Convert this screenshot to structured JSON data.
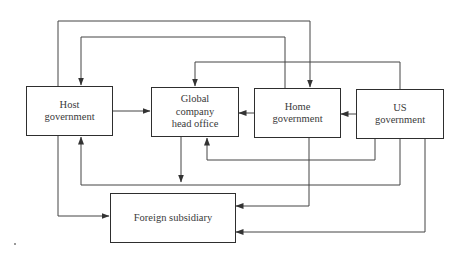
{
  "diagram": {
    "type": "flow",
    "nodes": [
      {
        "id": "host",
        "label": "Host\ngovernment"
      },
      {
        "id": "hq",
        "label": "Global\ncompany\nhead office"
      },
      {
        "id": "home",
        "label": "Home\ngovernment"
      },
      {
        "id": "us",
        "label": "US\ngovernment"
      },
      {
        "id": "sub",
        "label": "Foreign subsidiary"
      }
    ],
    "edges": [
      {
        "from": "host",
        "to": "hq"
      },
      {
        "from": "home",
        "to": "hq"
      },
      {
        "from": "us",
        "to": "home"
      },
      {
        "from": "host",
        "to": "home"
      },
      {
        "from": "home",
        "to": "host"
      },
      {
        "from": "us",
        "to": "hq"
      },
      {
        "from": "hq",
        "to": "sub"
      },
      {
        "from": "host",
        "to": "sub"
      },
      {
        "from": "us",
        "to": "hq"
      },
      {
        "from": "us",
        "to": "host"
      },
      {
        "from": "home",
        "to": "sub"
      },
      {
        "from": "us",
        "to": "sub"
      }
    ],
    "colors": {
      "line": "#333333",
      "text": "#3a3a3a",
      "background": "#ffffff"
    }
  }
}
